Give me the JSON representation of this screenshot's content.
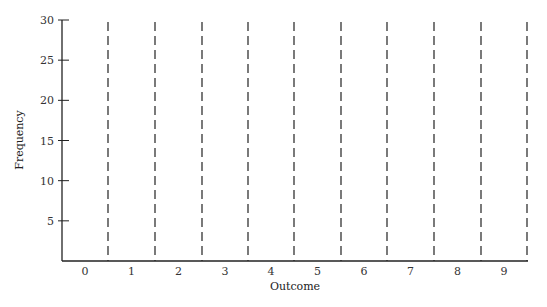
{
  "chart_data": {
    "type": "bar",
    "title": "",
    "xlabel": "Outcome",
    "ylabel": "Frequency",
    "categories": [
      "0",
      "1",
      "2",
      "3",
      "4",
      "5",
      "6",
      "7",
      "8",
      "9"
    ],
    "values": [
      null,
      null,
      null,
      null,
      null,
      null,
      null,
      null,
      null,
      null
    ],
    "ylim": [
      0,
      30
    ],
    "yticks": [
      5,
      10,
      15,
      20,
      25,
      30
    ],
    "grid": false,
    "legend": null,
    "annotations": "Empty frequency chart template; dashed vertical lines separate outcome bins"
  },
  "axes": {
    "x_title": "Outcome",
    "y_title": "Frequency",
    "y_tick_labels": [
      "5",
      "10",
      "15",
      "20",
      "25",
      "30"
    ],
    "x_tick_labels": [
      "0",
      "1",
      "2",
      "3",
      "4",
      "5",
      "6",
      "7",
      "8",
      "9"
    ]
  }
}
